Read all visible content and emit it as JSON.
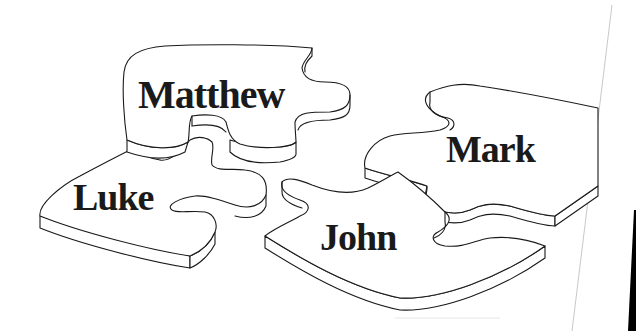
{
  "illustration": {
    "subject": "Four jigsaw puzzle pieces labeled with the Gospel names",
    "colors": {
      "ink": "#1a1a1a",
      "paper": "#ffffff",
      "page_edge": "#c8c8c8",
      "dark_margin": "#000000"
    },
    "pieces": [
      {
        "id": "matthew",
        "label": "Matthew"
      },
      {
        "id": "luke",
        "label": "Luke"
      },
      {
        "id": "mark",
        "label": "Mark"
      },
      {
        "id": "john",
        "label": "John"
      }
    ]
  }
}
